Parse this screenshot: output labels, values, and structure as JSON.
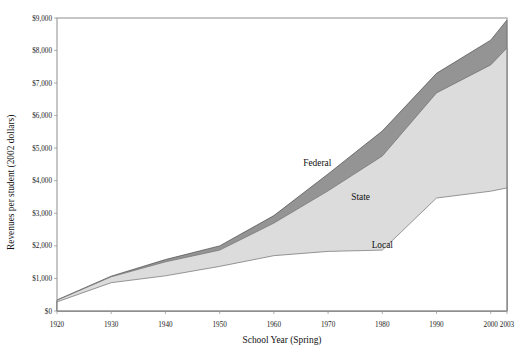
{
  "chart_data": {
    "type": "area",
    "title": "",
    "xlabel": "School Year (Spring)",
    "ylabel": "Revenues per student (2002 dollars)",
    "xlim": [
      1920,
      2003
    ],
    "ylim": [
      0,
      9000
    ],
    "grid": false,
    "legend_position": "inline-labels",
    "stacked": true,
    "stack_order_bottom_to_top": [
      "Local",
      "State",
      "Federal"
    ],
    "x": [
      1920,
      1930,
      1940,
      1950,
      1960,
      1970,
      1980,
      1990,
      2000,
      2003
    ],
    "xtick_labels": [
      "1920",
      "1930",
      "1940",
      "1950",
      "1960",
      "1970",
      "1980",
      "1990",
      "2000",
      "2003"
    ],
    "ytick_labels": [
      "$0",
      "$1,000",
      "$2,000",
      "$3,000",
      "$4,000",
      "$5,000",
      "$6,000",
      "$7,000",
      "$8,000",
      "$9,000"
    ],
    "ytick_values": [
      0,
      1000,
      2000,
      3000,
      4000,
      5000,
      6000,
      7000,
      8000,
      9000
    ],
    "series": [
      {
        "name": "Local",
        "color": "#ffffff",
        "values": [
          280,
          870,
          1080,
          1370,
          1700,
          1830,
          1870,
          3470,
          3680,
          3780
        ]
      },
      {
        "name": "State",
        "color": "#dcdcdc",
        "values": [
          50,
          180,
          430,
          500,
          1000,
          1860,
          2890,
          3230,
          3880,
          4300
        ]
      },
      {
        "name": "Federal",
        "color": "#949494",
        "values": [
          10,
          20,
          70,
          130,
          230,
          520,
          770,
          600,
          760,
          860
        ]
      }
    ],
    "stack_totals": [
      340,
      1070,
      1580,
      2000,
      2930,
      4210,
      5530,
      7300,
      8320,
      8940
    ],
    "series_labels": [
      {
        "text": "Federal",
        "x": 1968,
        "y": 4450
      },
      {
        "text": "State",
        "x": 1976,
        "y": 3400
      },
      {
        "text": "Local",
        "x": 1980,
        "y": 1950
      }
    ]
  },
  "axes": {
    "y_axis_title": "Revenues per student (2002 dollars)",
    "x_axis_title": "School Year (Spring)"
  }
}
